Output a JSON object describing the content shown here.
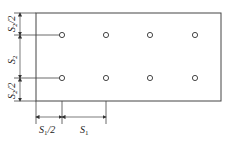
{
  "diagram": {
    "type": "hole-pattern-layout",
    "plate": {
      "x": 36,
      "y": 13,
      "width": 185,
      "height": 88
    },
    "rows": 2,
    "cols": 4,
    "holes": [
      {
        "x": 62,
        "y": 35
      },
      {
        "x": 106,
        "y": 35
      },
      {
        "x": 150,
        "y": 35
      },
      {
        "x": 195,
        "y": 35
      },
      {
        "x": 62,
        "y": 78
      },
      {
        "x": 106,
        "y": 78
      },
      {
        "x": 150,
        "y": 78
      },
      {
        "x": 195,
        "y": 78
      }
    ],
    "labels": {
      "s2_half_top": {
        "base": "S",
        "sub": "2",
        "suffix": "/2"
      },
      "s2": {
        "base": "S",
        "sub": "2",
        "suffix": ""
      },
      "s2_half_bottom": {
        "base": "S",
        "sub": "2",
        "suffix": "/2"
      },
      "s1_half": {
        "base": "S",
        "sub": "1",
        "suffix": "/2"
      },
      "s1": {
        "base": "S",
        "sub": "1",
        "suffix": ""
      }
    }
  }
}
